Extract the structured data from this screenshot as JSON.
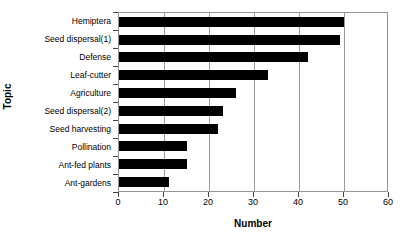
{
  "chart_data": {
    "type": "bar",
    "orientation": "horizontal",
    "title": "",
    "xlabel": "Number",
    "ylabel": "Topic",
    "categories": [
      "Hemiptera",
      "Seed dispersal(1)",
      "Defense",
      "Leaf-cutter",
      "Agriculture",
      "Seed dispersal(2)",
      "Seed harvesting",
      "Pollination",
      "Ant-fed plants",
      "Ant-gardens"
    ],
    "values": [
      50,
      49,
      42,
      33,
      26,
      23,
      22,
      15,
      15,
      11
    ],
    "xlim": [
      0,
      60
    ],
    "xticks": [
      0,
      10,
      20,
      30,
      40,
      50,
      60
    ],
    "xtick_labels": [
      "0",
      "10",
      "20",
      "30",
      "40",
      "50",
      "60"
    ],
    "grid": "vertical",
    "legend": "none",
    "bar_color": "#000000",
    "axis_color": "#949494"
  }
}
